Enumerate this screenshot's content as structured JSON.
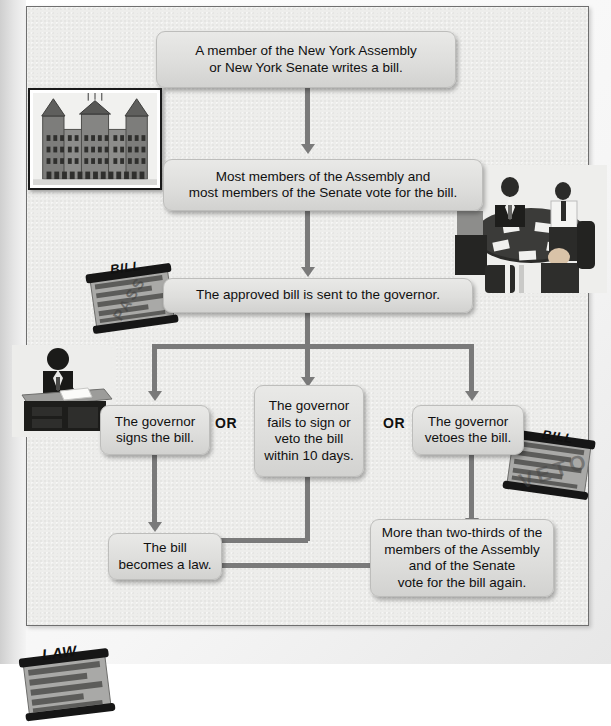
{
  "diagram": {
    "type": "flowchart",
    "background_color": "#ededeb",
    "box_color": "#dededc",
    "connector_color": "#7a7a7a",
    "nodes": [
      {
        "id": "n1",
        "text": "A member of the New York Assembly\nor New York Senate writes a bill."
      },
      {
        "id": "n2",
        "text": "Most members of the Assembly and\nmost members of the Senate vote for the bill."
      },
      {
        "id": "n3",
        "text": "The approved bill is sent to the governor."
      },
      {
        "id": "n4",
        "text": "The governor\nsigns the bill."
      },
      {
        "id": "n5",
        "text": "The governor\nfails to sign or\nveto the bill\nwithin 10 days."
      },
      {
        "id": "n6",
        "text": "The governor\nvetoes the bill."
      },
      {
        "id": "n7",
        "text": "More than two-thirds of the\nmembers of the Assembly\nand of the Senate\nvote for the bill again."
      },
      {
        "id": "n8",
        "text": "The bill\nbecomes a law."
      }
    ],
    "connector_labels": {
      "or_left": "OR",
      "or_right": "OR"
    },
    "illustrations": [
      {
        "id": "capitol",
        "name": "new-york-state-capitol-photo",
        "caption": ""
      },
      {
        "id": "legislators",
        "name": "legislators-at-round-table-photo",
        "caption": ""
      },
      {
        "id": "bill_pass",
        "name": "bill-scroll-pass",
        "label": "BILL",
        "stamp": "PASS"
      },
      {
        "id": "governor_desk",
        "name": "governor-signing-at-desk-photo",
        "caption": ""
      },
      {
        "id": "bill_veto",
        "name": "bill-scroll-veto",
        "label": "BILL",
        "stamp": "VETO"
      },
      {
        "id": "law_scroll",
        "name": "law-scroll",
        "label": "LAW",
        "stamp": ""
      }
    ]
  }
}
